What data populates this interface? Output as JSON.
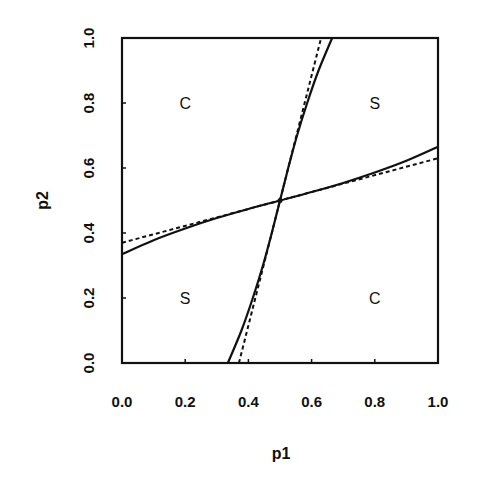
{
  "chart_data": {
    "type": "line",
    "title": "",
    "xlabel": "p1",
    "ylabel": "p2",
    "xlim": [
      0.0,
      1.0
    ],
    "ylim": [
      0.0,
      1.0
    ],
    "grid": false,
    "legend": null,
    "x_ticks": [
      "0.0",
      "0.2",
      "0.4",
      "0.6",
      "0.8",
      "1.0"
    ],
    "y_ticks": [
      "0.0",
      "0.2",
      "0.4",
      "0.6",
      "0.8",
      "1.0"
    ],
    "series": [
      {
        "name": "best-response curve p2(p1)",
        "style": "solid",
        "x": [
          0.0,
          0.1,
          0.2,
          0.3,
          0.4,
          0.5,
          0.6,
          0.7,
          0.8,
          0.9,
          1.0
        ],
        "y": [
          0.335,
          0.378,
          0.414,
          0.446,
          0.474,
          0.5,
          0.526,
          0.554,
          0.586,
          0.622,
          0.665
        ]
      },
      {
        "name": "best-response curve p1(p2)",
        "style": "solid",
        "x": [
          0.335,
          0.378,
          0.414,
          0.446,
          0.474,
          0.5,
          0.526,
          0.554,
          0.586,
          0.622,
          0.665
        ],
        "y": [
          0.0,
          0.1,
          0.2,
          0.3,
          0.4,
          0.5,
          0.6,
          0.7,
          0.8,
          0.9,
          1.0
        ]
      },
      {
        "name": "linear approximation p2(p1)",
        "style": "dashed",
        "x": [
          0.0,
          1.0
        ],
        "y": [
          0.37,
          0.63
        ]
      },
      {
        "name": "linear approximation p1(p2)",
        "style": "dashed",
        "x": [
          0.37,
          0.63
        ],
        "y": [
          0.0,
          1.0
        ]
      }
    ],
    "intersection": {
      "x": 0.5,
      "y": 0.5
    },
    "annotations": [
      {
        "text": "C",
        "x": 0.2,
        "y": 0.8
      },
      {
        "text": "S",
        "x": 0.8,
        "y": 0.8
      },
      {
        "text": "S",
        "x": 0.2,
        "y": 0.2
      },
      {
        "text": "C",
        "x": 0.8,
        "y": 0.2
      }
    ]
  },
  "plot": {
    "left": 122,
    "top": 38,
    "right": 438,
    "bottom": 363,
    "line_color": "#111111"
  }
}
